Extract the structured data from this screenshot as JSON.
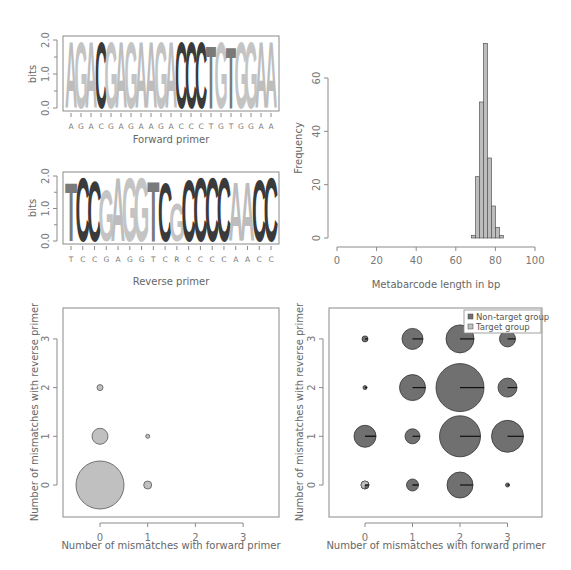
{
  "colors": {
    "A": "#bdbdbd",
    "G": "#c4c4c4",
    "C": "#3a3a3a",
    "T": "#7a7a7a",
    "hist_fill": "#bdbdbd",
    "non_target": "#707070",
    "target": "#c0c0c0",
    "axis": "#8a8a8a"
  },
  "chart_data": [
    {
      "id": "forward-logo",
      "type": "sequence-logo",
      "title": "",
      "xlabel": "Forward primer",
      "ylabel": "bits",
      "ylim": [
        0,
        2
      ],
      "yticks": [
        "0.0",
        "1.0",
        "2.0"
      ],
      "sequence": [
        "A",
        "G",
        "A",
        "C",
        "G",
        "A",
        "G",
        "A",
        "A",
        "G",
        "A",
        "C",
        "C",
        "C",
        "T",
        "G",
        "T",
        "G",
        "G",
        "A",
        "A"
      ],
      "heights": [
        2,
        2,
        2,
        2,
        2,
        2,
        2,
        2,
        2,
        2,
        2,
        2,
        2,
        2,
        1.9,
        2,
        1.85,
        2,
        2,
        2,
        2
      ]
    },
    {
      "id": "reverse-logo",
      "type": "sequence-logo",
      "title": "",
      "xlabel": "Reverse primer",
      "ylabel": "bits",
      "ylim": [
        0,
        2
      ],
      "yticks": [
        "0.0",
        "1.0",
        "2.0"
      ],
      "sequence": [
        "T",
        "C",
        "C",
        "G",
        "A",
        "G",
        "G",
        "T",
        "C",
        "R",
        "C",
        "C",
        "C",
        "C",
        "A",
        "A",
        "C",
        "C"
      ],
      "logo_letters": [
        "T",
        "C",
        "C",
        "G",
        "A",
        "G",
        "G",
        "T",
        "C",
        "G",
        "C",
        "C",
        "C",
        "C",
        "A",
        "A",
        "C",
        "C"
      ],
      "heights": [
        1.85,
        2,
        1.9,
        1.6,
        2,
        2,
        2,
        1.9,
        1.85,
        1.2,
        1.95,
        2,
        2,
        2,
        1.85,
        1.85,
        1.95,
        2
      ]
    },
    {
      "id": "length-histogram",
      "type": "bar",
      "title": "",
      "xlabel": "Metabarcode length in bp",
      "ylabel": "Frequency",
      "xlim": [
        0,
        100
      ],
      "ylim": [
        0,
        70
      ],
      "xticks": [
        "0",
        "20",
        "40",
        "60",
        "80",
        "100"
      ],
      "yticks": [
        "0",
        "20",
        "40",
        "60"
      ],
      "bin_width": 2,
      "bins": [
        {
          "from": 68,
          "to": 70,
          "count": 1
        },
        {
          "from": 70,
          "to": 72,
          "count": 23
        },
        {
          "from": 72,
          "to": 74,
          "count": 51
        },
        {
          "from": 74,
          "to": 76,
          "count": 73
        },
        {
          "from": 76,
          "to": 78,
          "count": 30
        },
        {
          "from": 78,
          "to": 80,
          "count": 12
        },
        {
          "from": 80,
          "to": 82,
          "count": 4
        },
        {
          "from": 82,
          "to": 84,
          "count": 1
        }
      ]
    },
    {
      "id": "target-mismatch-bubbles",
      "type": "scatter",
      "title": "",
      "xlabel": "Number of mismatches with forward primer",
      "ylabel": "Number of mismatches with reverse primer",
      "xticks": [
        "0",
        "1",
        "2",
        "3"
      ],
      "yticks": [
        "0",
        "1",
        "2",
        "3"
      ],
      "xlim": [
        -0.75,
        3.75
      ],
      "ylim": [
        -0.65,
        3.65
      ],
      "points": [
        {
          "x": 0,
          "y": 0,
          "radius_px": 24
        },
        {
          "x": 1,
          "y": 0,
          "radius_px": 4
        },
        {
          "x": 0,
          "y": 1,
          "radius_px": 8
        },
        {
          "x": 1,
          "y": 1,
          "radius_px": 2
        },
        {
          "x": 0,
          "y": 2,
          "radius_px": 3
        }
      ]
    },
    {
      "id": "all-mismatch-pies",
      "type": "scatter",
      "title": "",
      "xlabel": "Number of mismatches with forward primer",
      "ylabel": "Number of mismatches with reverse primer",
      "xticks": [
        "0",
        "1",
        "2",
        "3"
      ],
      "yticks": [
        "0",
        "1",
        "2",
        "3"
      ],
      "xlim": [
        -0.75,
        3.75
      ],
      "ylim": [
        -0.65,
        3.65
      ],
      "legend": [
        {
          "label": "Non-target group",
          "color_key": "non_target"
        },
        {
          "label": "Target group",
          "color_key": "target"
        }
      ],
      "points": [
        {
          "x": 0,
          "y": 0,
          "radius_px": 4,
          "target_fraction": 0.75
        },
        {
          "x": 1,
          "y": 0,
          "radius_px": 6,
          "target_fraction": 0.02
        },
        {
          "x": 2,
          "y": 0,
          "radius_px": 13,
          "target_fraction": 0
        },
        {
          "x": 3,
          "y": 0,
          "radius_px": 2,
          "target_fraction": 0
        },
        {
          "x": 0,
          "y": 1,
          "radius_px": 11,
          "target_fraction": 0.01
        },
        {
          "x": 1,
          "y": 1,
          "radius_px": 7.5,
          "target_fraction": 0
        },
        {
          "x": 2,
          "y": 1,
          "radius_px": 20.5,
          "target_fraction": 0
        },
        {
          "x": 3,
          "y": 1,
          "radius_px": 16,
          "target_fraction": 0
        },
        {
          "x": 0,
          "y": 2,
          "radius_px": 2,
          "target_fraction": 0.1
        },
        {
          "x": 1,
          "y": 2,
          "radius_px": 13,
          "target_fraction": 0
        },
        {
          "x": 2,
          "y": 2,
          "radius_px": 24,
          "target_fraction": 0
        },
        {
          "x": 3,
          "y": 2,
          "radius_px": 9.5,
          "target_fraction": 0
        },
        {
          "x": 0,
          "y": 3,
          "radius_px": 3,
          "target_fraction": 0
        },
        {
          "x": 1,
          "y": 3,
          "radius_px": 10.5,
          "target_fraction": 0
        },
        {
          "x": 2,
          "y": 3,
          "radius_px": 14,
          "target_fraction": 0
        },
        {
          "x": 3,
          "y": 3,
          "radius_px": 8,
          "target_fraction": 0
        }
      ]
    }
  ]
}
